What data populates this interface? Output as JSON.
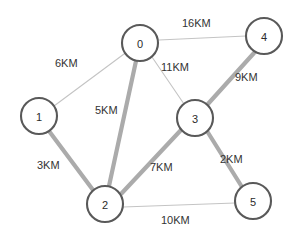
{
  "figure": {
    "title": "",
    "background_color": "#ffffff",
    "width": 302,
    "height": 240
  },
  "style": {
    "node_fill": "#ffffff",
    "node_stroke": "#595959",
    "node_radius": 18,
    "edge_thin_color": "#c4c4c4",
    "edge_thick_color": "#ababab",
    "label_color": "#333333",
    "unit": "KM"
  },
  "nodes": [
    {
      "id": "0",
      "label": "0",
      "x": 140,
      "y": 43
    },
    {
      "id": "1",
      "label": "1",
      "x": 39,
      "y": 116
    },
    {
      "id": "2",
      "label": "2",
      "x": 105,
      "y": 204
    },
    {
      "id": "3",
      "label": "3",
      "x": 195,
      "y": 118
    },
    {
      "id": "4",
      "label": "4",
      "x": 264,
      "y": 36
    },
    {
      "id": "5",
      "label": "5",
      "x": 253,
      "y": 201
    }
  ],
  "edges": [
    {
      "id": "e-0-4",
      "from": "0",
      "to": "4",
      "weight": 16,
      "label": "16KM",
      "highlighted": false,
      "x1": 159,
      "y1": 40,
      "x2": 246,
      "y2": 36,
      "label_x": 182,
      "label_y": 17
    },
    {
      "id": "e-0-1",
      "from": "0",
      "to": "1",
      "weight": 6,
      "label": "6KM",
      "highlighted": false,
      "x1": 124,
      "y1": 54,
      "x2": 54,
      "y2": 106,
      "label_x": 55,
      "label_y": 57
    },
    {
      "id": "e-0-3",
      "from": "0",
      "to": "3",
      "weight": 11,
      "label": "11KM",
      "highlighted": false,
      "x1": 152,
      "y1": 57,
      "x2": 184,
      "y2": 104,
      "label_x": 161,
      "label_y": 61
    },
    {
      "id": "e-0-2",
      "from": "0",
      "to": "2",
      "weight": 5,
      "label": "5KM",
      "highlighted": true,
      "x1": 136,
      "y1": 61,
      "x2": 109,
      "y2": 186,
      "label_x": 95,
      "label_y": 104
    },
    {
      "id": "e-3-4",
      "from": "3",
      "to": "4",
      "weight": 9,
      "label": "9KM",
      "highlighted": true,
      "x1": 207,
      "y1": 105,
      "x2": 254,
      "y2": 53,
      "label_x": 235,
      "label_y": 71
    },
    {
      "id": "e-1-2",
      "from": "1",
      "to": "2",
      "weight": 3,
      "label": "3KM",
      "highlighted": true,
      "x1": 49,
      "y1": 131,
      "x2": 93,
      "y2": 190,
      "label_x": 37,
      "label_y": 159
    },
    {
      "id": "e-2-3",
      "from": "2",
      "to": "3",
      "weight": 7,
      "label": "7KM",
      "highlighted": true,
      "x1": 121,
      "y1": 194,
      "x2": 181,
      "y2": 130,
      "label_x": 150,
      "label_y": 161
    },
    {
      "id": "e-3-5",
      "from": "3",
      "to": "5",
      "weight": 2,
      "label": "2KM",
      "highlighted": true,
      "x1": 207,
      "y1": 131,
      "x2": 242,
      "y2": 187,
      "label_x": 220,
      "label_y": 153
    },
    {
      "id": "e-2-5",
      "from": "2",
      "to": "5",
      "weight": 10,
      "label": "10KM",
      "highlighted": false,
      "x1": 123,
      "y1": 207,
      "x2": 235,
      "y2": 203,
      "label_x": 161,
      "label_y": 214
    }
  ],
  "chart_data": {
    "type": "diagram",
    "diagram_type": "weighted-undirected-graph",
    "title": "",
    "nodes": [
      "0",
      "1",
      "2",
      "3",
      "4",
      "5"
    ],
    "edges": [
      {
        "source": "0",
        "target": "1",
        "weight": 6,
        "label": "6KM",
        "highlighted": false
      },
      {
        "source": "0",
        "target": "2",
        "weight": 5,
        "label": "5KM",
        "highlighted": true
      },
      {
        "source": "0",
        "target": "3",
        "weight": 11,
        "label": "11KM",
        "highlighted": false
      },
      {
        "source": "0",
        "target": "4",
        "weight": 16,
        "label": "16KM",
        "highlighted": false
      },
      {
        "source": "1",
        "target": "2",
        "weight": 3,
        "label": "3KM",
        "highlighted": true
      },
      {
        "source": "2",
        "target": "3",
        "weight": 7,
        "label": "7KM",
        "highlighted": true
      },
      {
        "source": "2",
        "target": "5",
        "weight": 10,
        "label": "10KM",
        "highlighted": false
      },
      {
        "source": "3",
        "target": "4",
        "weight": 9,
        "label": "9KM",
        "highlighted": true
      },
      {
        "source": "3",
        "target": "5",
        "weight": 2,
        "label": "2KM",
        "highlighted": true
      }
    ],
    "edge_weight_unit": "KM",
    "highlighted_edge_total": 26,
    "legend": [],
    "xlabel": "",
    "ylabel": ""
  }
}
